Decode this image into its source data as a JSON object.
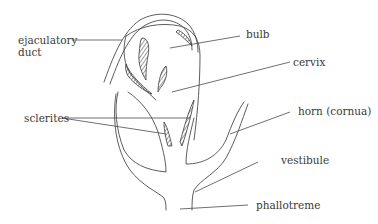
{
  "diagram": {
    "type": "anatomical-line-drawing",
    "labels": {
      "ejaculatory_duct_line1": "ejaculatory",
      "ejaculatory_duct_line2": "duct",
      "bulb": "bulb",
      "cervix": "cervix",
      "sclerites": "sclerites",
      "horn": "horn (cornua)",
      "vestibule": "vestibule",
      "phallotreme": "phallotreme"
    },
    "colors": {
      "background": "#ffffff",
      "line": "#4a4a4a",
      "text": "#3a3a3a"
    }
  }
}
